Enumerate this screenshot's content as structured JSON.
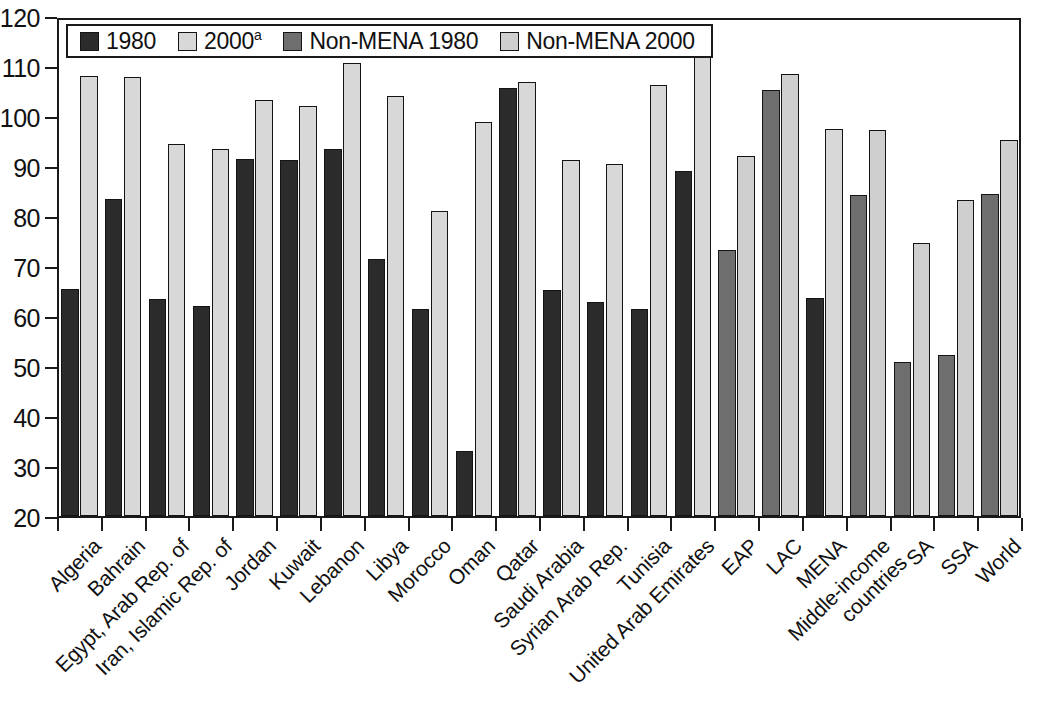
{
  "chart_data": {
    "type": "bar",
    "title": "",
    "subtitle": "",
    "xlabel": "",
    "ylabel": "",
    "ylim": [
      20,
      120
    ],
    "ytick_step": 10,
    "yticks": [
      120,
      110,
      100,
      90,
      80,
      70,
      60,
      50,
      40,
      30,
      20
    ],
    "grid": false,
    "legend_position": "top-left-inside",
    "categories": [
      "Algeria",
      "Bahrain",
      "Egypt, Arab Rep. of",
      "Iran, Islamic Rep. of",
      "Jordan",
      "Kuwait",
      "Lebanon",
      "Libya",
      "Morocco",
      "Oman",
      "Qatar",
      "Saudi Arabia",
      "Syrian Arab Rep.",
      "Tunisia",
      "United Arab Emirates",
      "EAP",
      "LAC",
      "MENA",
      "Middle-income countries",
      "SA",
      "SSA",
      "World"
    ],
    "category_label_lines": [
      [
        "Algeria"
      ],
      [
        "Bahrain"
      ],
      [
        "Egypt, Arab Rep. of"
      ],
      [
        "Iran, Islamic Rep. of"
      ],
      [
        "Jordan"
      ],
      [
        "Kuwait"
      ],
      [
        "Lebanon"
      ],
      [
        "Libya"
      ],
      [
        "Morocco"
      ],
      [
        "Oman"
      ],
      [
        "Qatar"
      ],
      [
        "Saudi Arabia"
      ],
      [
        "Syrian Arab Rep."
      ],
      [
        "Tunisia"
      ],
      [
        "United Arab Emirates"
      ],
      [
        "EAP"
      ],
      [
        "LAC"
      ],
      [
        "MENA"
      ],
      [
        "Middle-income",
        "countries"
      ],
      [
        "SA"
      ],
      [
        "SSA"
      ],
      [
        "World"
      ]
    ],
    "series": [
      {
        "name": "1980",
        "color": "#2b2b2b",
        "style_key": "s-dark",
        "values": [
          65.4,
          83.5,
          63.5,
          62.0,
          91.5,
          91.2,
          93.4,
          71.4,
          61.4,
          33.1,
          105.6,
          65.2,
          62.8,
          61.5,
          89.0,
          null,
          null,
          63.7,
          null,
          null,
          null,
          null
        ]
      },
      {
        "name": "2000ᵃ",
        "color": "#d8d8d8",
        "style_key": "s-light",
        "values": [
          108.0,
          107.8,
          94.4,
          93.5,
          103.3,
          102.0,
          110.6,
          104.0,
          81.1,
          98.9,
          106.9,
          91.2,
          90.5,
          106.3,
          112.8,
          null,
          null,
          97.5,
          null,
          null,
          null,
          null
        ]
      },
      {
        "name": "Non-MENA 1980",
        "color": "#6e6e6e",
        "style_key": "s-med",
        "values": [
          null,
          null,
          null,
          null,
          null,
          null,
          null,
          null,
          null,
          null,
          null,
          null,
          null,
          null,
          null,
          73.3,
          105.2,
          null,
          84.2,
          50.8,
          52.2,
          84.4
        ]
      },
      {
        "name": "Non-MENA 2000",
        "color": "#cfcfcf",
        "style_key": "s-light2",
        "values": [
          null,
          null,
          null,
          null,
          null,
          null,
          null,
          null,
          null,
          null,
          null,
          null,
          null,
          null,
          null,
          92.1,
          108.5,
          null,
          97.2,
          74.6,
          83.3,
          95.2
        ]
      }
    ],
    "legend_entries": [
      {
        "label": "1980",
        "sup": "",
        "style_key": "s-dark",
        "color": "#2b2b2b"
      },
      {
        "label": "2000",
        "sup": "a",
        "style_key": "s-light",
        "color": "#d8d8d8"
      },
      {
        "label": "Non-MENA 1980",
        "sup": "",
        "style_key": "s-med",
        "color": "#6e6e6e"
      },
      {
        "label": "Non-MENA 2000",
        "sup": "",
        "style_key": "s-light2",
        "color": "#cfcfcf"
      }
    ]
  }
}
